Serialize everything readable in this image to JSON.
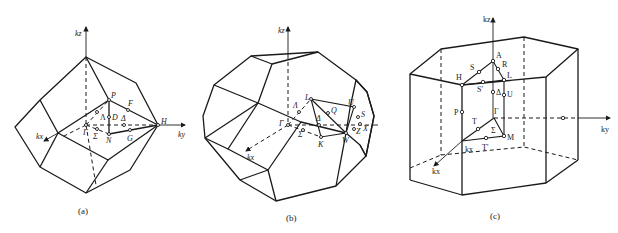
{
  "figure": {
    "panels": [
      {
        "id": "a",
        "caption": "(a)",
        "axes": {
          "kz": "kz",
          "ky": "ky",
          "kx": "kx"
        },
        "points": {
          "P": "P",
          "F": "F",
          "Lambda": "Λ",
          "D": "D",
          "Delta": "Δ",
          "H": "H",
          "Gamma": "Γ",
          "Sigma": "Σ",
          "N": "N",
          "G": "G"
        }
      },
      {
        "id": "b",
        "caption": "(b)",
        "axes": {
          "kz": "kz",
          "ky": "ky",
          "kx": "kx"
        },
        "points": {
          "L": "L",
          "Lambda": "Λ",
          "Q": "Q",
          "U": "U",
          "S": "S",
          "Gamma": "Γ",
          "Delta": "Δ",
          "Sigma": "Σ",
          "K": "K",
          "W": "W",
          "Z": "Z",
          "X": "X"
        }
      },
      {
        "id": "c",
        "caption": "(c)",
        "axes": {
          "kz": "kz",
          "ky": "ky",
          "kx": "kx",
          "kx_corner": "kx"
        },
        "points": {
          "A": "A",
          "S": "S",
          "R": "R",
          "H": "H",
          "L": "L",
          "S_prime": "S'",
          "Delta": "Δ",
          "U": "U",
          "P": "P",
          "Gamma": "Γ",
          "T": "T",
          "Sigma": "Σ",
          "M": "M",
          "T_prime": "T'"
        }
      }
    ]
  }
}
